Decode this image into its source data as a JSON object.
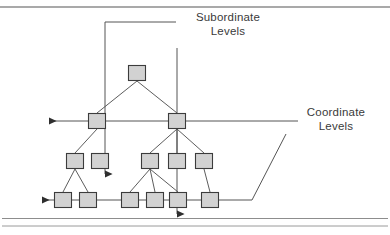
{
  "figure": {
    "type": "hierarchy-tree-diagram",
    "annotations": {
      "subordinate": {
        "line1": "Subordinate",
        "line2": "Levels"
      },
      "coordinate": {
        "line1": "Coordinate",
        "line2": "Levels"
      }
    },
    "colors": {
      "node_fill": "#d2d2d2",
      "node_stroke": "#3c3c3c",
      "edge_stroke": "#4a4a4a",
      "annotation_stroke": "#555555",
      "rule_stroke": "#8a8a8a",
      "text": "#3a3a3a",
      "background": "#ffffff"
    },
    "node_size": {
      "width": 17,
      "height": 15
    },
    "levels": [
      {
        "level": 1,
        "name": "root-level",
        "nodes": [
          {
            "id": "n1",
            "cx": 137,
            "cy": 73
          }
        ]
      },
      {
        "level": 2,
        "name": "coordinate-level-upper",
        "nodes": [
          {
            "id": "n2",
            "cx": 97,
            "cy": 121
          },
          {
            "id": "n3",
            "cx": 177,
            "cy": 121
          }
        ]
      },
      {
        "level": 3,
        "name": "third-level",
        "nodes": [
          {
            "id": "n4",
            "cx": 75,
            "cy": 161
          },
          {
            "id": "n5",
            "cx": 100,
            "cy": 161
          },
          {
            "id": "n6",
            "cx": 150,
            "cy": 161
          },
          {
            "id": "n7",
            "cx": 177,
            "cy": 161
          },
          {
            "id": "n8",
            "cx": 204,
            "cy": 161
          }
        ]
      },
      {
        "level": 4,
        "name": "coordinate-level-lower",
        "nodes": [
          {
            "id": "n9",
            "cx": 63,
            "cy": 200
          },
          {
            "id": "n10",
            "cx": 88,
            "cy": 200
          },
          {
            "id": "n11",
            "cx": 130,
            "cy": 200
          },
          {
            "id": "n12",
            "cx": 155,
            "cy": 200
          },
          {
            "id": "n13",
            "cx": 178,
            "cy": 200
          },
          {
            "id": "n14",
            "cx": 210,
            "cy": 200
          }
        ]
      }
    ],
    "edges": [
      {
        "from": "n1",
        "to": "n2"
      },
      {
        "from": "n1",
        "to": "n3"
      },
      {
        "from": "n2",
        "to": "n4"
      },
      {
        "from": "n3",
        "to": "n6"
      },
      {
        "from": "n3",
        "to": "n7"
      },
      {
        "from": "n3",
        "to": "n8"
      },
      {
        "from": "n4",
        "to": "n9"
      },
      {
        "from": "n4",
        "to": "n10"
      },
      {
        "from": "n6",
        "to": "n11"
      },
      {
        "from": "n6",
        "to": "n12"
      },
      {
        "from": "n6",
        "to": "n13"
      },
      {
        "from": "n8",
        "to": "n14"
      }
    ],
    "subordinate_arrows": [
      {
        "id": "sub-left",
        "x": 105,
        "y_start": 22,
        "y_end": 176
      },
      {
        "id": "sub-right",
        "x": 177,
        "y_start": 48,
        "y_end": 216
      }
    ],
    "coordinate_arrows": [
      {
        "id": "coord-upper",
        "y": 121,
        "x_start": 298,
        "x_end": 47
      },
      {
        "id": "coord-lower",
        "y": 200,
        "x_start": 252,
        "x_end": 40
      }
    ],
    "leader_lines": {
      "subordinate_top": {
        "x1": 105,
        "y1": 22,
        "x2": 176,
        "y2": 22
      },
      "coordinate_upper": {
        "x1": 298,
        "y1": 121,
        "x2": 180,
        "y2": 121
      },
      "coordinate_diagonal": {
        "points": "286,133 252,200"
      }
    },
    "rules": [
      {
        "id": "rule-top",
        "y": 7
      },
      {
        "id": "rule-bottom-1",
        "y": 218
      },
      {
        "id": "rule-bottom-2",
        "y": 226
      }
    ]
  }
}
